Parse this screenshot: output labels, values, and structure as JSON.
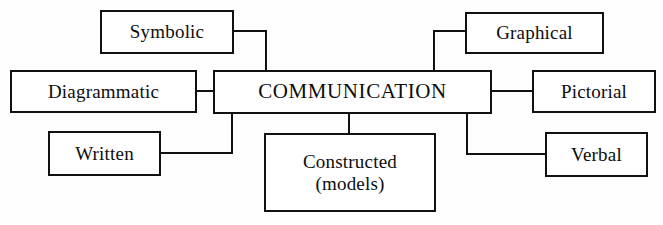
{
  "figure": {
    "type": "concept-map",
    "title": "COMMUNICATION",
    "background_color": "#fefefe",
    "line_color": "#111111",
    "text_color": "#0d0d0d"
  },
  "nodes": {
    "center": {
      "id": "communication",
      "label": "COMMUNICATION",
      "x": 213,
      "y": 70,
      "w": 279,
      "h": 44,
      "font_size": 21
    },
    "branches": [
      {
        "id": "symbolic",
        "label": "Symbolic",
        "x": 100,
        "y": 10,
        "w": 134,
        "h": 44,
        "font_size": 19,
        "side": "upper-left"
      },
      {
        "id": "diagrammatic",
        "label": "Diagrammatic",
        "x": 10,
        "y": 70,
        "w": 187,
        "h": 43,
        "font_size": 19,
        "side": "left"
      },
      {
        "id": "written",
        "label": "Written",
        "x": 48,
        "y": 131,
        "w": 113,
        "h": 45,
        "font_size": 19,
        "side": "lower-left"
      },
      {
        "id": "constructed-models",
        "label": "Constructed\n(models)",
        "x": 264,
        "y": 133,
        "w": 172,
        "h": 79,
        "font_size": 19,
        "side": "bottom"
      },
      {
        "id": "graphical",
        "label": "Graphical",
        "x": 465,
        "y": 12,
        "w": 139,
        "h": 42,
        "font_size": 19,
        "side": "upper-right"
      },
      {
        "id": "pictorial",
        "label": "Pictorial",
        "x": 532,
        "y": 70,
        "w": 124,
        "h": 43,
        "font_size": 19,
        "side": "right"
      },
      {
        "id": "verbal",
        "label": "Verbal",
        "x": 545,
        "y": 132,
        "w": 103,
        "h": 45,
        "font_size": 19,
        "side": "lower-right"
      }
    ]
  },
  "edges": [
    {
      "id": "edge-symbolic-h",
      "orient": "h",
      "x": 234,
      "y": 30,
      "len": 33
    },
    {
      "id": "edge-symbolic-v",
      "orient": "v",
      "x": 265,
      "y": 30,
      "len": 42
    },
    {
      "id": "edge-diagrammatic",
      "orient": "h",
      "x": 197,
      "y": 90,
      "len": 18
    },
    {
      "id": "edge-written-h",
      "orient": "h",
      "x": 161,
      "y": 152,
      "len": 72
    },
    {
      "id": "edge-written-v",
      "orient": "v",
      "x": 231,
      "y": 112,
      "len": 42
    },
    {
      "id": "edge-constructed",
      "orient": "v",
      "x": 348,
      "y": 112,
      "len": 23
    },
    {
      "id": "edge-graphical-h",
      "orient": "h",
      "x": 433,
      "y": 30,
      "len": 34
    },
    {
      "id": "edge-graphical-v",
      "orient": "v",
      "x": 433,
      "y": 30,
      "len": 42
    },
    {
      "id": "edge-pictorial",
      "orient": "h",
      "x": 490,
      "y": 90,
      "len": 44
    },
    {
      "id": "edge-verbal-v",
      "orient": "v",
      "x": 466,
      "y": 112,
      "len": 43
    },
    {
      "id": "edge-verbal-h",
      "orient": "h",
      "x": 466,
      "y": 153,
      "len": 81
    }
  ]
}
